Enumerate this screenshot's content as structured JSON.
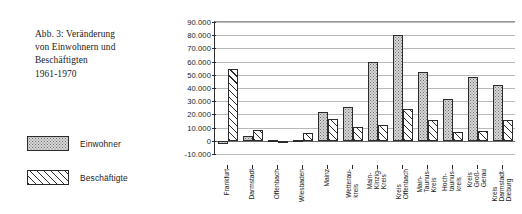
{
  "caption": {
    "lines": [
      "Abb. 3: Veränderung",
      "von Einwohnern und",
      "Beschäftigten",
      "1961-1970"
    ]
  },
  "legend": {
    "position": "left",
    "entries": [
      {
        "label": "Einwohner",
        "fill": "dotted",
        "color": "#d8d8d8"
      },
      {
        "label": "Beschäftigte",
        "fill": "diagonal-hatch",
        "color": "#ffffff"
      }
    ]
  },
  "chart_data": {
    "type": "bar",
    "title": "Abb. 3: Veränderung von Einwohnern und Beschäftigten 1961-1970",
    "xlabel": "",
    "ylabel": "",
    "ylim": [
      -10000,
      90000
    ],
    "ytick_labels": [
      "90.000",
      "80.000",
      "70.000",
      "60.000",
      "50.000",
      "40.000",
      "30.000",
      "20.000",
      "10.000",
      "0",
      "-10.000"
    ],
    "ytick_values": [
      90000,
      80000,
      70000,
      60000,
      50000,
      40000,
      30000,
      20000,
      10000,
      0,
      -10000
    ],
    "grid": true,
    "categories": [
      "Frankfurt",
      "Darmstadt",
      "Offenbach",
      "Wiesbaden",
      "Mainz",
      "Wetterau-\nkreis",
      "Main-\nKinzig-\nKreis",
      "Kreis\nOffenbach",
      "Main-\nTaunus-\nKreis",
      "Hoch-\ntaunus-\nkreis",
      "Kreis\nGroß-\nGerau",
      "Kreis\nDarmstadt-\nDieburg"
    ],
    "series": [
      {
        "name": "Einwohner",
        "values": [
          -2500,
          4000,
          500,
          800,
          21800,
          25700,
          59500,
          79800,
          51800,
          31500,
          48700,
          42000
        ]
      },
      {
        "name": "Beschäftigte",
        "values": [
          54500,
          8400,
          -700,
          5800,
          16700,
          10400,
          11900,
          23800,
          15500,
          6300,
          7200,
          16100
        ]
      }
    ]
  }
}
